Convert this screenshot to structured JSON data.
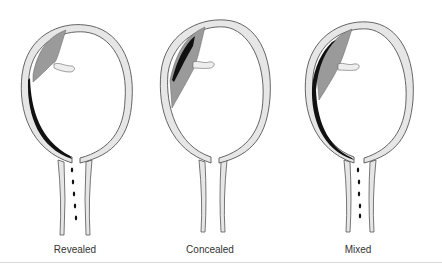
{
  "diagram": {
    "panels": [
      {
        "id": "revealed",
        "label": "Revealed",
        "bleeding_visible": true,
        "clot_position": "behind placenta extending to cervix"
      },
      {
        "id": "concealed",
        "label": "Concealed",
        "bleeding_visible": false,
        "clot_position": "retroplacental only"
      },
      {
        "id": "mixed",
        "label": "Mixed",
        "bleeding_visible": true,
        "clot_position": "retroplacental and tracking to cervix"
      }
    ],
    "colors": {
      "uterine_wall_fill": "#e6e6e6",
      "outline": "#555555",
      "placenta": "#9a9a9a",
      "clot": "#111111",
      "label_text": "#333333"
    }
  }
}
